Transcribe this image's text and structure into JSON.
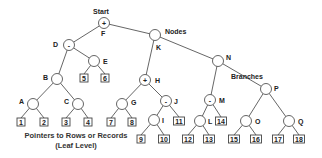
{
  "labels": {
    "start": "Start",
    "nodes": "Nodes",
    "branches": "Branches",
    "caption_line1": "Pointers to Rows or Records",
    "caption_line2": "(Leaf Level)"
  },
  "nodes": [
    {
      "id": "F",
      "x": 104,
      "y": 23,
      "symbol": "+",
      "label": "F",
      "lx": 101,
      "ly": 36
    },
    {
      "id": "D",
      "x": 69,
      "y": 45,
      "symbol": "-",
      "label": "D",
      "lx": 53,
      "ly": 47
    },
    {
      "id": "K",
      "x": 155,
      "y": 35,
      "symbol": "",
      "label": "K",
      "lx": 156,
      "ly": 50
    },
    {
      "id": "E",
      "x": 94,
      "y": 61,
      "symbol": "",
      "label": "E",
      "lx": 103,
      "ly": 64
    },
    {
      "id": "B",
      "x": 57,
      "y": 79,
      "symbol": "",
      "label": "B",
      "lx": 43,
      "ly": 80
    },
    {
      "id": "A",
      "x": 33,
      "y": 104,
      "symbol": "",
      "label": "A",
      "lx": 19,
      "ly": 104
    },
    {
      "id": "C",
      "x": 78,
      "y": 104,
      "symbol": "",
      "label": "C",
      "lx": 64,
      "ly": 104
    },
    {
      "id": "H",
      "x": 145,
      "y": 80,
      "symbol": "+",
      "label": "H",
      "lx": 155,
      "ly": 83
    },
    {
      "id": "G",
      "x": 122,
      "y": 104,
      "symbol": "",
      "label": "G",
      "lx": 131,
      "ly": 105
    },
    {
      "id": "J",
      "x": 166,
      "y": 101,
      "symbol": "-",
      "label": "J",
      "lx": 174,
      "ly": 104
    },
    {
      "id": "I",
      "x": 154,
      "y": 120,
      "symbol": "",
      "label": "I",
      "lx": 162,
      "ly": 123
    },
    {
      "id": "N",
      "x": 218,
      "y": 61,
      "symbol": "",
      "label": "N",
      "lx": 226,
      "ly": 60
    },
    {
      "id": "P",
      "x": 266,
      "y": 89,
      "symbol": "",
      "label": "P",
      "lx": 274,
      "ly": 91
    },
    {
      "id": "M",
      "x": 210,
      "y": 100,
      "symbol": "-",
      "label": "M",
      "lx": 219,
      "ly": 103
    },
    {
      "id": "L",
      "x": 200,
      "y": 121,
      "symbol": "",
      "label": "L",
      "lx": 208,
      "ly": 124
    },
    {
      "id": "O",
      "x": 246,
      "y": 121,
      "symbol": "",
      "label": "O",
      "lx": 255,
      "ly": 124
    },
    {
      "id": "Q",
      "x": 289,
      "y": 121,
      "symbol": "",
      "label": "Q",
      "lx": 298,
      "ly": 124
    }
  ],
  "edges": [
    [
      "F",
      "D"
    ],
    [
      "F",
      "K"
    ],
    [
      "D",
      "E"
    ],
    [
      "D",
      "B"
    ],
    [
      "B",
      "A"
    ],
    [
      "B",
      "C"
    ],
    [
      "K",
      "H"
    ],
    [
      "K",
      "N"
    ],
    [
      "H",
      "G"
    ],
    [
      "H",
      "J"
    ],
    [
      "J",
      "I"
    ],
    [
      "N",
      "M"
    ],
    [
      "N",
      "P"
    ],
    [
      "M",
      "L"
    ],
    [
      "P",
      "O"
    ],
    [
      "P",
      "Q"
    ]
  ],
  "leaves": [
    {
      "text": "5",
      "x": 84,
      "y": 78,
      "parent": "E"
    },
    {
      "text": "6",
      "x": 105,
      "y": 78,
      "parent": "E"
    },
    {
      "text": "1",
      "x": 21,
      "y": 122,
      "parent": "A"
    },
    {
      "text": "2",
      "x": 44,
      "y": 122,
      "parent": "A"
    },
    {
      "text": "3",
      "x": 66,
      "y": 122,
      "parent": "C"
    },
    {
      "text": "4",
      "x": 88,
      "y": 122,
      "parent": "C"
    },
    {
      "text": "7",
      "x": 111,
      "y": 122,
      "parent": "G"
    },
    {
      "text": "8",
      "x": 132,
      "y": 122,
      "parent": "G"
    },
    {
      "text": "11",
      "x": 179,
      "y": 121,
      "parent": "J"
    },
    {
      "text": "9",
      "x": 141,
      "y": 139,
      "parent": "I"
    },
    {
      "text": "10",
      "x": 164,
      "y": 139,
      "parent": "I"
    },
    {
      "text": "14",
      "x": 221,
      "y": 121,
      "parent": "M"
    },
    {
      "text": "12",
      "x": 188,
      "y": 139,
      "parent": "L"
    },
    {
      "text": "13",
      "x": 209,
      "y": 139,
      "parent": "L"
    },
    {
      "text": "15",
      "x": 234,
      "y": 139,
      "parent": "O"
    },
    {
      "text": "16",
      "x": 256,
      "y": 139,
      "parent": "O"
    },
    {
      "text": "17",
      "x": 278,
      "y": 139,
      "parent": "Q"
    },
    {
      "text": "18",
      "x": 299,
      "y": 139,
      "parent": "Q"
    }
  ]
}
